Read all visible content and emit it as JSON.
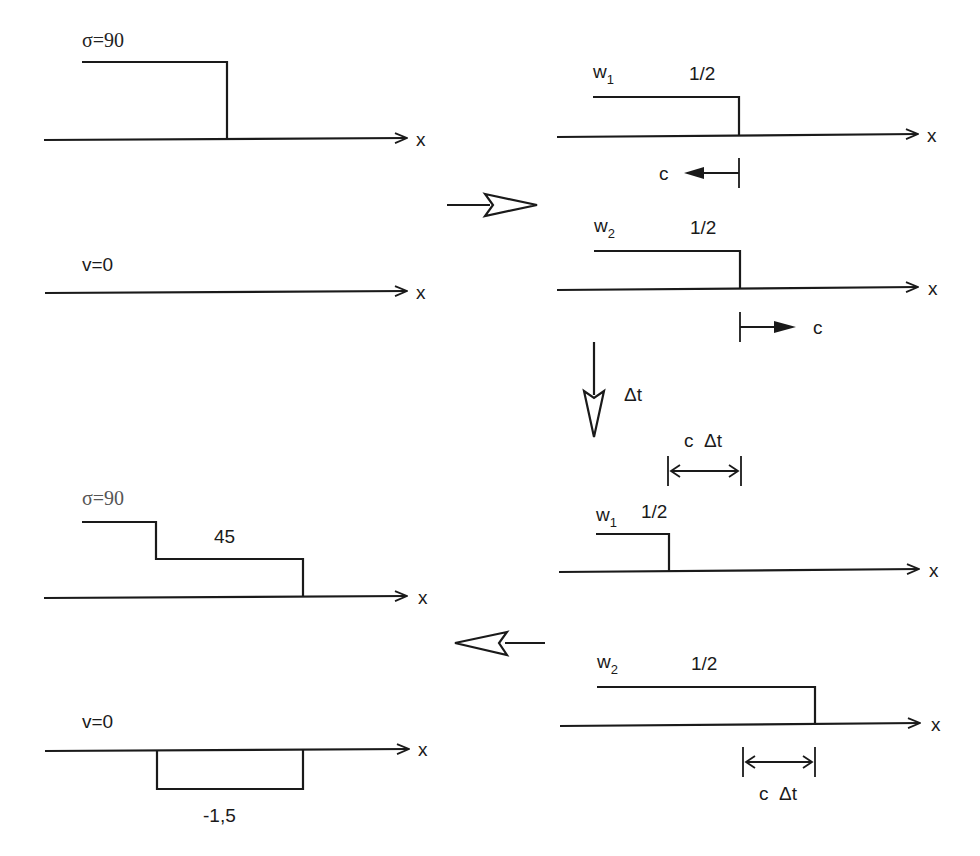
{
  "figure": {
    "initial": {
      "stress": {
        "label": "σ=90",
        "value": 90,
        "axis_label": "x"
      },
      "velocity": {
        "label": "v=0",
        "value": 0,
        "axis_label": "x"
      }
    },
    "split": {
      "arrow": "hollow-right-arrow",
      "w1": {
        "name": "w",
        "subscript": "1",
        "value_label": "1/2",
        "axis_label": "x",
        "velocity_label": "c",
        "direction": "left"
      },
      "w2": {
        "name": "w",
        "subscript": "2",
        "value_label": "1/2",
        "axis_label": "x",
        "velocity_label": "c",
        "direction": "right"
      }
    },
    "time_step": {
      "arrow": "hollow-down-arrow",
      "label": "Δt"
    },
    "advected": {
      "shift_label": "c  Δt",
      "w1": {
        "name": "w",
        "subscript": "1",
        "value_label": "1/2",
        "axis_label": "x"
      },
      "w2": {
        "name": "w",
        "subscript": "2",
        "value_label": "1/2",
        "axis_label": "x"
      }
    },
    "recombine": {
      "arrow": "hollow-left-arrow"
    },
    "result": {
      "stress": {
        "label": "σ=90",
        "value_high": 90,
        "step_label": "45",
        "step_value": 45,
        "axis_label": "x"
      },
      "velocity": {
        "label": "v=0",
        "value": 0,
        "step_label": "-1,5",
        "step_value": -1.5,
        "axis_label": "x"
      }
    }
  }
}
